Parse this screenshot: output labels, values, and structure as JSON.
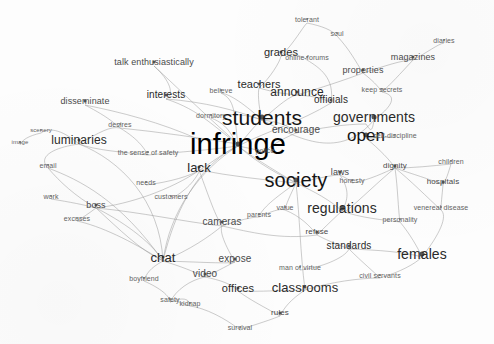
{
  "figure": {
    "type": "word-network-graph",
    "title": "",
    "background_color": "#fdfdfd",
    "edge_color": "#9a9a9a",
    "node_text_color": "#1b1b1b",
    "width": 494,
    "height": 344
  },
  "chart_data": {
    "type": "scatter",
    "title": "",
    "xlabel": "",
    "ylabel": "",
    "grid": false,
    "legend": "none",
    "nodes": [
      {
        "label": "infringe",
        "x": 238,
        "y": 144,
        "size": 29,
        "weight": "huge"
      },
      {
        "label": "students",
        "x": 262,
        "y": 117,
        "size": 21,
        "weight": "large"
      },
      {
        "label": "society",
        "x": 296,
        "y": 180,
        "size": 20,
        "weight": "large"
      },
      {
        "label": "open",
        "x": 366,
        "y": 135,
        "size": 17,
        "weight": "large"
      },
      {
        "label": "governments",
        "x": 374,
        "y": 117,
        "size": 14,
        "weight": "medium"
      },
      {
        "label": "regulations",
        "x": 342,
        "y": 208,
        "size": 14,
        "weight": "medium"
      },
      {
        "label": "females",
        "x": 422,
        "y": 254,
        "size": 14,
        "weight": "medium"
      },
      {
        "label": "classrooms",
        "x": 305,
        "y": 287,
        "size": 13,
        "weight": "medium"
      },
      {
        "label": "announce",
        "x": 297,
        "y": 92,
        "size": 12,
        "weight": "medium"
      },
      {
        "label": "lack",
        "x": 199,
        "y": 167,
        "size": 13,
        "weight": "medium"
      },
      {
        "label": "chat",
        "x": 163,
        "y": 257,
        "size": 13,
        "weight": "medium"
      },
      {
        "label": "teachers",
        "x": 259,
        "y": 84,
        "size": 11,
        "weight": "medium"
      },
      {
        "label": "grades",
        "x": 281,
        "y": 52,
        "size": 11,
        "weight": "medium"
      },
      {
        "label": "luminaries",
        "x": 79,
        "y": 140,
        "size": 12,
        "weight": "medium"
      },
      {
        "label": "offices",
        "x": 238,
        "y": 288,
        "size": 11,
        "weight": "medium"
      },
      {
        "label": "standards",
        "x": 349,
        "y": 246,
        "size": 10,
        "weight": "medium"
      },
      {
        "label": "interests",
        "x": 166,
        "y": 95,
        "size": 10,
        "weight": "medium"
      },
      {
        "label": "officials",
        "x": 331,
        "y": 100,
        "size": 10,
        "weight": "medium"
      },
      {
        "label": "encourage",
        "x": 296,
        "y": 130,
        "size": 10,
        "weight": "small"
      },
      {
        "label": "cameras",
        "x": 222,
        "y": 222,
        "size": 10,
        "weight": "small"
      },
      {
        "label": "video",
        "x": 205,
        "y": 274,
        "size": 10,
        "weight": "small"
      },
      {
        "label": "expose",
        "x": 235,
        "y": 259,
        "size": 10,
        "weight": "small"
      },
      {
        "label": "talk enthusiastically",
        "x": 154,
        "y": 62,
        "size": 9,
        "weight": "small"
      },
      {
        "label": "disseminate",
        "x": 85,
        "y": 101,
        "size": 9,
        "weight": "small"
      },
      {
        "label": "properties",
        "x": 363,
        "y": 70,
        "size": 9,
        "weight": "small"
      },
      {
        "label": "magazines",
        "x": 413,
        "y": 57,
        "size": 9,
        "weight": "small"
      },
      {
        "label": "laws",
        "x": 340,
        "y": 172,
        "size": 9,
        "weight": "small"
      },
      {
        "label": "refuse",
        "x": 317,
        "y": 232,
        "size": 8,
        "weight": "small"
      },
      {
        "label": "rules",
        "x": 280,
        "y": 313,
        "size": 8,
        "weight": "small"
      },
      {
        "label": "hospitals",
        "x": 443,
        "y": 182,
        "size": 8,
        "weight": "small"
      },
      {
        "label": "boss",
        "x": 96,
        "y": 205,
        "size": 9,
        "weight": "small"
      },
      {
        "label": "self-discipline",
        "x": 395,
        "y": 135,
        "size": 7,
        "weight": "tiny"
      },
      {
        "label": "dignity",
        "x": 395,
        "y": 166,
        "size": 8,
        "weight": "small"
      },
      {
        "label": "children",
        "x": 451,
        "y": 161,
        "size": 7,
        "weight": "tiny"
      },
      {
        "label": "venereal disease",
        "x": 441,
        "y": 207,
        "size": 7,
        "weight": "tiny"
      },
      {
        "label": "personality",
        "x": 400,
        "y": 219,
        "size": 7,
        "weight": "tiny"
      },
      {
        "label": "honesty",
        "x": 352,
        "y": 180,
        "size": 7,
        "weight": "tiny"
      },
      {
        "label": "civil servants",
        "x": 380,
        "y": 275,
        "size": 7,
        "weight": "tiny"
      },
      {
        "label": "man of virtue",
        "x": 300,
        "y": 267,
        "size": 7,
        "weight": "tiny"
      },
      {
        "label": "keep secrets",
        "x": 382,
        "y": 89,
        "size": 7,
        "weight": "tiny"
      },
      {
        "label": "diaries",
        "x": 444,
        "y": 40,
        "size": 7,
        "weight": "tiny"
      },
      {
        "label": "online-forums",
        "x": 307,
        "y": 57,
        "size": 7,
        "weight": "tiny"
      },
      {
        "label": "tolerant",
        "x": 307,
        "y": 19,
        "size": 7,
        "weight": "tiny"
      },
      {
        "label": "soul",
        "x": 337,
        "y": 33,
        "size": 7,
        "weight": "tiny"
      },
      {
        "label": "believe",
        "x": 221,
        "y": 90,
        "size": 7,
        "weight": "tiny"
      },
      {
        "label": "dormitory",
        "x": 211,
        "y": 115,
        "size": 7,
        "weight": "tiny"
      },
      {
        "label": "police",
        "x": 265,
        "y": 150,
        "size": 7,
        "weight": "tiny"
      },
      {
        "label": "value",
        "x": 285,
        "y": 207,
        "size": 7,
        "weight": "tiny"
      },
      {
        "label": "parents",
        "x": 259,
        "y": 214,
        "size": 7,
        "weight": "tiny"
      },
      {
        "label": "desires",
        "x": 120,
        "y": 124,
        "size": 7,
        "weight": "tiny"
      },
      {
        "label": "the sense of safety",
        "x": 148,
        "y": 152,
        "size": 7,
        "weight": "tiny"
      },
      {
        "label": "needs",
        "x": 146,
        "y": 182,
        "size": 7,
        "weight": "tiny"
      },
      {
        "label": "customers",
        "x": 171,
        "y": 196,
        "size": 7,
        "weight": "tiny"
      },
      {
        "label": "email",
        "x": 48,
        "y": 165,
        "size": 7,
        "weight": "tiny"
      },
      {
        "label": "work",
        "x": 51,
        "y": 196,
        "size": 7,
        "weight": "tiny"
      },
      {
        "label": "excuses",
        "x": 77,
        "y": 218,
        "size": 7,
        "weight": "tiny"
      },
      {
        "label": "scenery",
        "x": 41,
        "y": 130,
        "size": 6,
        "weight": "tiny"
      },
      {
        "label": "image",
        "x": 20,
        "y": 142,
        "size": 6,
        "weight": "tiny"
      },
      {
        "label": "boyfriend",
        "x": 144,
        "y": 278,
        "size": 7,
        "weight": "tiny"
      },
      {
        "label": "safety",
        "x": 170,
        "y": 299,
        "size": 7,
        "weight": "tiny"
      },
      {
        "label": "kidnap",
        "x": 190,
        "y": 303,
        "size": 7,
        "weight": "tiny"
      },
      {
        "label": "survival",
        "x": 240,
        "y": 327,
        "size": 7,
        "weight": "tiny"
      }
    ]
  }
}
